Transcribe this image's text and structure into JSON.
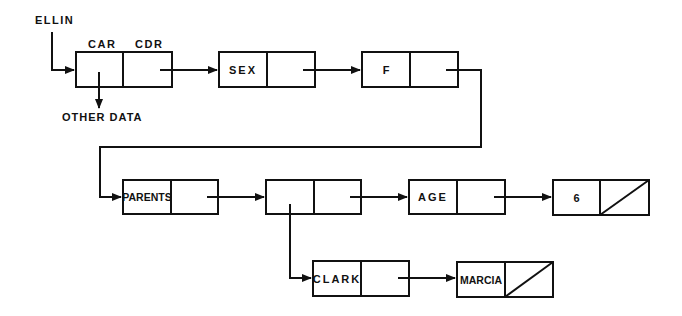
{
  "diagram": {
    "type": "lisp-linked-list",
    "pointer_label": "ELLIN",
    "header_labels": {
      "car": "CAR",
      "cdr": "CDR"
    },
    "other_data_label": "OTHER DATA",
    "nodes": [
      {
        "id": "n1",
        "car": "",
        "cdr": "pointer",
        "note": "CAR points to OTHER DATA"
      },
      {
        "id": "n2",
        "car": "SEX",
        "cdr": "pointer"
      },
      {
        "id": "n3",
        "car": "F",
        "cdr": "pointer"
      },
      {
        "id": "n4",
        "car": "PARENTS",
        "cdr": "pointer"
      },
      {
        "id": "n5",
        "car": "",
        "cdr": "pointer",
        "note": "CAR points to sublist CLARK"
      },
      {
        "id": "n6",
        "car": "AGE",
        "cdr": "pointer"
      },
      {
        "id": "n7",
        "car": "6",
        "cdr": "NIL"
      },
      {
        "id": "n8",
        "car": "CLARK",
        "cdr": "pointer"
      },
      {
        "id": "n9",
        "car": "MARCIA",
        "cdr": "NIL"
      }
    ],
    "edges": [
      {
        "from": "ELLIN",
        "to": "n1"
      },
      {
        "from": "n1.car",
        "to": "OTHER DATA"
      },
      {
        "from": "n1.cdr",
        "to": "n2"
      },
      {
        "from": "n2.cdr",
        "to": "n3"
      },
      {
        "from": "n3.cdr",
        "to": "n4"
      },
      {
        "from": "n4.cdr",
        "to": "n5"
      },
      {
        "from": "n5.cdr",
        "to": "n6"
      },
      {
        "from": "n6.cdr",
        "to": "n7"
      },
      {
        "from": "n5.car",
        "to": "n8"
      },
      {
        "from": "n8.cdr",
        "to": "n9"
      }
    ],
    "colors": {
      "ink": "#111111",
      "background": "#ffffff"
    }
  }
}
